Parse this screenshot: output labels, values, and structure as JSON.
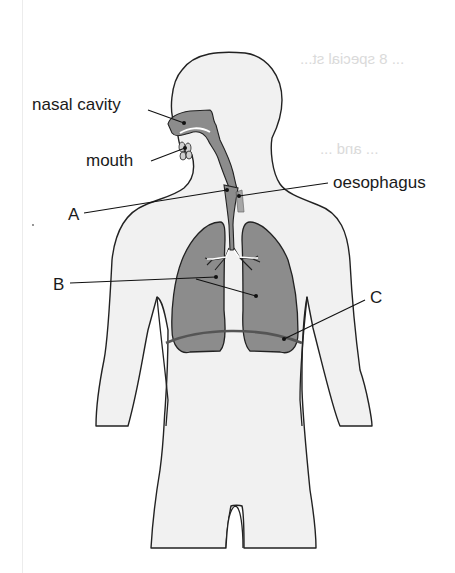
{
  "diagram": {
    "colors": {
      "body_fill": "#f1f1f1",
      "organ_fill": "#8c8c8c",
      "outline": "#222222",
      "label_text": "#1a1a1a"
    },
    "labels": {
      "nasal_cavity": "nasal cavity",
      "mouth": "mouth",
      "oesophagus": "oesophagus",
      "a": "A",
      "b": "B",
      "c": "C"
    },
    "bleed_through": {
      "line1": "... 8 special st...",
      "line2": "... and ..."
    }
  }
}
